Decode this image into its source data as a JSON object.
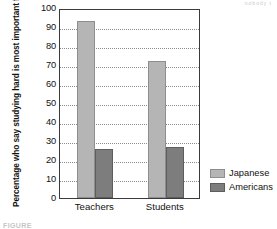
{
  "chart_data": {
    "type": "bar",
    "title": "",
    "xlabel": "",
    "ylabel": "Percentage who say studying hard is most important for math performance",
    "ylim": [
      0,
      100
    ],
    "ytick_step": 10,
    "grid": true,
    "legend_position": "right",
    "categories": [
      "Teachers",
      "Students"
    ],
    "yticks": [
      "100",
      "90",
      "80",
      "70",
      "60",
      "50",
      "40",
      "30",
      "20",
      "10",
      "0"
    ],
    "series": [
      {
        "name": "Japanese",
        "color": "#b5b5b5",
        "values": [
          93,
          72
        ]
      },
      {
        "name": "Americans",
        "color": "#7d7d7d",
        "values": [
          26,
          27
        ]
      }
    ]
  },
  "artifacts": {
    "top_right": "nobody t",
    "bottom_left": "FIGURE"
  }
}
